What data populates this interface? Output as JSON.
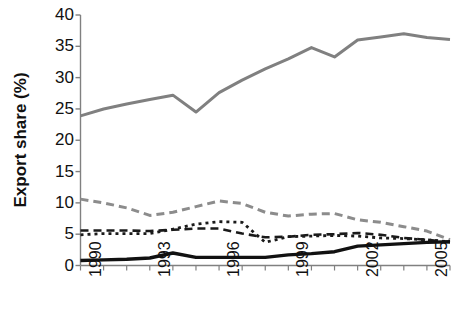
{
  "chart_data": {
    "type": "line",
    "title": "",
    "xlabel": "",
    "ylabel": "Export share (%)",
    "xlim": [
      1990,
      2006
    ],
    "ylim": [
      0,
      40
    ],
    "ytick_values": [
      0,
      5,
      10,
      15,
      20,
      25,
      30,
      35,
      40
    ],
    "ytick_labels": [
      "0",
      "5",
      "10",
      "15",
      "20",
      "25",
      "30",
      "35",
      "40"
    ],
    "xtick_values": [
      1990,
      1993,
      1996,
      1999,
      2002,
      2005
    ],
    "xtick_labels": [
      "1990",
      "1993",
      "1996",
      "1999",
      "2002",
      "2005"
    ],
    "x": [
      1990,
      1991,
      1992,
      1993,
      1994,
      1995,
      1996,
      1997,
      1998,
      1999,
      2000,
      2001,
      2002,
      2003,
      2004,
      2005,
      2006
    ],
    "grid": false,
    "legend": "none",
    "series": [
      {
        "name": "series-1-gray-solid",
        "style": "solid",
        "color": "#808080",
        "width": 3,
        "values": [
          23.9,
          25.0,
          25.8,
          26.5,
          27.2,
          24.5,
          27.6,
          29.6,
          31.4,
          33.0,
          34.8,
          33.3,
          36.0,
          36.5,
          37.0,
          36.4,
          36.1
        ]
      },
      {
        "name": "series-2-gray-dashed",
        "style": "dashed",
        "color": "#8c8c8c",
        "width": 3,
        "values": [
          10.6,
          10.0,
          9.2,
          8.0,
          8.5,
          9.4,
          10.3,
          9.9,
          8.5,
          7.9,
          8.2,
          8.3,
          7.3,
          6.9,
          6.2,
          5.5,
          4.1
        ]
      },
      {
        "name": "series-3-black-dashed",
        "style": "dashed",
        "color": "#1a1a1a",
        "width": 2.6,
        "values": [
          5.6,
          5.6,
          5.6,
          5.5,
          5.7,
          5.9,
          5.9,
          5.1,
          4.5,
          4.6,
          4.9,
          5.0,
          5.2,
          4.9,
          4.4,
          4.1,
          3.7
        ]
      },
      {
        "name": "series-4-black-dotted",
        "style": "dotted",
        "color": "#1a1a1a",
        "width": 2.8,
        "values": [
          4.9,
          5.1,
          5.1,
          5.1,
          5.8,
          6.6,
          7.0,
          6.9,
          3.7,
          4.6,
          4.7,
          4.8,
          4.7,
          4.4,
          4.3,
          4.1,
          3.8
        ]
      },
      {
        "name": "series-5-black-solid",
        "style": "solid",
        "color": "#111111",
        "width": 3.4,
        "values": [
          0.8,
          0.9,
          1.0,
          1.2,
          2.0,
          1.3,
          1.3,
          1.3,
          1.3,
          1.7,
          1.9,
          2.2,
          3.1,
          3.3,
          3.5,
          3.7,
          3.8
        ]
      }
    ]
  },
  "axis": {
    "y_label_text": "Export share (%)"
  }
}
